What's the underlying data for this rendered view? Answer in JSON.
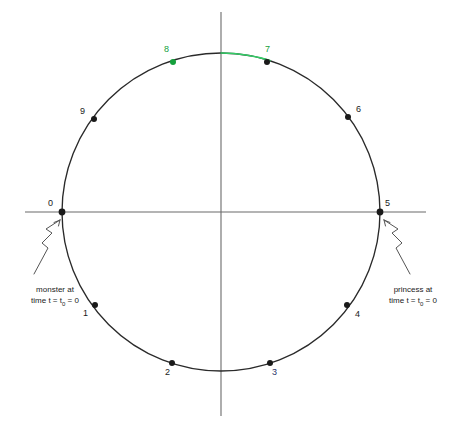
{
  "figure": {
    "type": "diagram",
    "background_color": "#ffffff",
    "line_color": "#2a2a2a",
    "axis_color": "#6b6b6b",
    "accent_green": "#14a03c",
    "navy": "#2b3368",
    "center": {
      "x": 221,
      "y": 212
    },
    "radius": 159,
    "axes": {
      "horizontal": {
        "x1": 25,
        "y1": 212,
        "x2": 426,
        "y2": 212
      },
      "vertical": {
        "x1": 221,
        "y1": 12,
        "x2": 221,
        "y2": 416
      }
    },
    "points": [
      {
        "id": "0",
        "label": "0",
        "angle_deg": 180,
        "dot_x": 62,
        "dot_y": 212,
        "label_x": 48,
        "label_y": 198,
        "dot_color": "#1a1a1a",
        "label_color": "#1a1a1a",
        "dot_r": 3.4
      },
      {
        "id": "1",
        "label": "1",
        "angle_deg": 216,
        "dot_x": 95,
        "dot_y": 305,
        "label_x": 83,
        "label_y": 308,
        "dot_color": "#1a1a1a",
        "label_color": "#1a1a1a",
        "dot_r": 3.0
      },
      {
        "id": "2",
        "label": "2",
        "angle_deg": 252,
        "dot_x": 172,
        "dot_y": 363,
        "label_x": 165,
        "label_y": 367,
        "dot_color": "#1a1a1a",
        "label_color": "#1a1a1a",
        "dot_r": 3.0
      },
      {
        "id": "3",
        "label": "3",
        "angle_deg": 288,
        "dot_x": 270,
        "dot_y": 363,
        "label_x": 272,
        "label_y": 367,
        "dot_color": "#1a1a1a",
        "label_color": "#2b3368",
        "dot_r": 3.0
      },
      {
        "id": "4",
        "label": "4",
        "angle_deg": 324,
        "dot_x": 347,
        "dot_y": 305,
        "label_x": 355,
        "label_y": 309,
        "dot_color": "#1a1a1a",
        "label_color": "#1a1a1a",
        "dot_r": 3.0
      },
      {
        "id": "5",
        "label": "5",
        "angle_deg": 0,
        "dot_x": 380,
        "dot_y": 212,
        "label_x": 385,
        "label_y": 198,
        "dot_color": "#1a1a1a",
        "label_color": "#1a1a1a",
        "dot_r": 3.4
      },
      {
        "id": "6",
        "label": "6",
        "angle_deg": 36,
        "dot_x": 348,
        "dot_y": 117,
        "label_x": 356,
        "label_y": 104,
        "dot_color": "#1a1a1a",
        "label_color": "#1a1a1a",
        "dot_r": 3.0
      },
      {
        "id": "7",
        "label": "7",
        "angle_deg": 72,
        "dot_x": 267,
        "dot_y": 62,
        "label_x": 265,
        "label_y": 44,
        "dot_color": "#1a1a1a",
        "label_color": "#14a03c",
        "dot_r": 3.0
      },
      {
        "id": "8",
        "label": "8",
        "angle_deg": 108,
        "dot_x": 173,
        "dot_y": 62,
        "label_x": 164,
        "label_y": 44,
        "dot_color": "#14a03c",
        "label_color": "#14a03c",
        "dot_r": 3.0
      },
      {
        "id": "9",
        "label": "9",
        "angle_deg": 144,
        "dot_x": 94,
        "dot_y": 119,
        "label_x": 80,
        "label_y": 106,
        "dot_color": "#1a1a1a",
        "label_color": "#1a1a1a",
        "dot_r": 3.0
      }
    ],
    "highlight_arc": {
      "color": "#33cc66",
      "from_angle_deg": 90,
      "to_angle_deg": 72,
      "note": "green arc from top of circle to point 7"
    },
    "annotations": [
      {
        "id": "monster",
        "line1": "monster at",
        "line2_pre": "time t = t",
        "line2_sub": "0",
        "line2_post": " = 0",
        "text_x": 10,
        "text_y": 285,
        "target_point": "0"
      },
      {
        "id": "princess",
        "line1": "princess at",
        "line2_pre": "time t = t",
        "line2_sub": "0",
        "line2_post": " = 0",
        "text_x": 373,
        "text_y": 285,
        "target_point": "5"
      }
    ]
  }
}
